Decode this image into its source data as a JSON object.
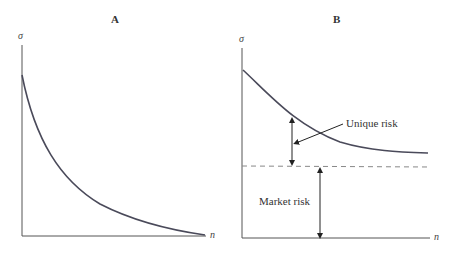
{
  "panels": [
    {
      "id": "A",
      "title": "A",
      "y_axis_label": "σ",
      "x_axis_label": "n",
      "curve": "Portfolio standard deviation decreasing toward zero as n increases"
    },
    {
      "id": "B",
      "title": "B",
      "y_axis_label": "σ",
      "x_axis_label": "n",
      "curve": "Portfolio standard deviation decreasing toward the market-risk asymptote",
      "annotations": {
        "unique_risk": "Unique risk",
        "market_risk": "Market risk"
      }
    }
  ],
  "colors": {
    "curve": "#4a4a5a",
    "axis": "#555555",
    "dashed": "#888888"
  }
}
